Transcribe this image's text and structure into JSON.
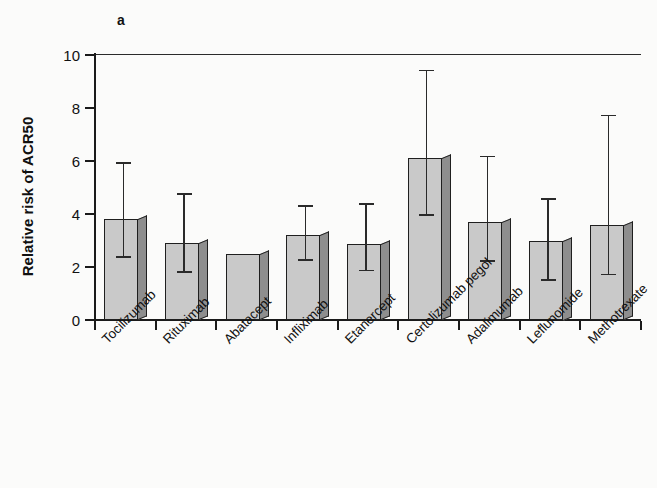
{
  "figure": {
    "panel_letter": "a"
  },
  "chart_data": {
    "type": "bar",
    "title": "",
    "panel": "a",
    "xlabel": "",
    "ylabel": "Relative risk of ACR50",
    "ylim": [
      0,
      10
    ],
    "yticks": [
      0,
      2,
      4,
      6,
      8,
      10
    ],
    "ytick_labels": [
      "0",
      "2",
      "4",
      "6",
      "8",
      "10"
    ],
    "grid": false,
    "legend": null,
    "orientation": "vertical",
    "bar_style": "3d-shaded",
    "categories": [
      "Tocilizumab",
      "Rituximab",
      "Abatacept",
      "Infliximab",
      "Etanercept",
      "Certolizumab pegol",
      "Adalimumab",
      "Leflunomide",
      "Methotrexate"
    ],
    "values": [
      3.8,
      2.9,
      2.5,
      3.2,
      2.85,
      6.1,
      3.7,
      3.0,
      3.6
    ],
    "error_low": [
      2.4,
      1.85,
      null,
      2.3,
      1.9,
      4.0,
      2.25,
      1.55,
      1.75
    ],
    "error_high": [
      5.95,
      4.8,
      null,
      4.35,
      4.4,
      9.45,
      6.2,
      4.6,
      7.75
    ],
    "colors": {
      "bar_face": "#c9c9c9",
      "bar_side": "#8e8e8e",
      "bar_outline": "#1f1f1f",
      "axis": "#1a1a1a",
      "error": "#2a2a2a",
      "background": "#fbfbfa"
    }
  }
}
